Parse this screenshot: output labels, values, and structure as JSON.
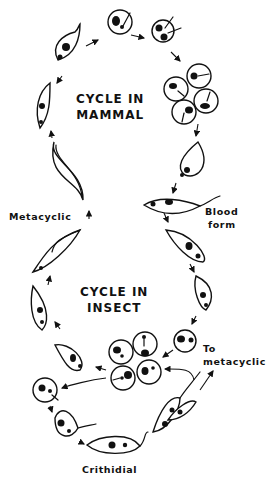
{
  "diagram": {
    "titles": {
      "mammal_line1": "CYCLE IN",
      "mammal_line2": "MAMMAL",
      "insect_line1": "CYCLE IN",
      "insect_line2": "INSECT"
    },
    "labels": {
      "metacyclic": "Metacyclic",
      "blood_form_line1": "Blood",
      "blood_form_line2": "form",
      "to_metacyclic_line1": "To",
      "to_metacyclic_line2": "metacyclic",
      "crithidial": "Crithidial"
    },
    "colors": {
      "ink": "#111111",
      "background": "#ffffff"
    }
  }
}
